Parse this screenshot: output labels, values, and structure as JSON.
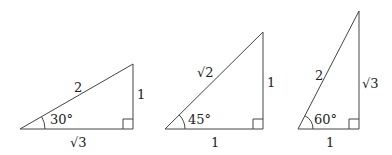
{
  "diagram": {
    "stroke_color": "#444444",
    "triangles": [
      {
        "id": "30-60-90-a",
        "angle_label": "30°",
        "hypotenuse_label": "2",
        "vertical_leg_label": "1",
        "base_label": "√3",
        "vertices": {
          "left": [
            20,
            129
          ],
          "right_angle": [
            133,
            129
          ],
          "top": [
            133,
            64
          ]
        }
      },
      {
        "id": "45-45-90",
        "angle_label": "45°",
        "hypotenuse_label": "√2",
        "vertical_leg_label": "1",
        "base_label": "1",
        "vertices": {
          "left": [
            165,
            129
          ],
          "right_angle": [
            263,
            129
          ],
          "top": [
            263,
            32
          ]
        }
      },
      {
        "id": "30-60-90-b",
        "angle_label": "60°",
        "hypotenuse_label": "2",
        "vertical_leg_label": "√3",
        "base_label": "1",
        "vertices": {
          "left": [
            298,
            129
          ],
          "right_angle": [
            359,
            129
          ],
          "top": [
            359,
            11
          ]
        }
      }
    ]
  }
}
